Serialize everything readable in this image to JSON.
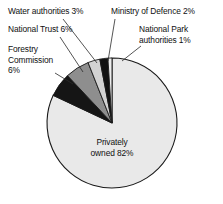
{
  "chart_data": {
    "type": "pie",
    "title": "",
    "subtitle": "",
    "xlabel": "",
    "ylabel": "",
    "legend_position": "none",
    "grid": false,
    "unit": "%",
    "total": 100,
    "start_angle_deg": 0,
    "direction": "counterclockwise",
    "categories": [
      "National Park authorities",
      "Ministry of Defence",
      "Water authorities",
      "National Trust",
      "Forestry Commission",
      "Privately owned"
    ],
    "values": [
      1,
      2,
      3,
      6,
      6,
      82
    ],
    "slices": [
      {
        "name": "National Park authorities",
        "value": 1,
        "label": "National Park\nauthorities 1%",
        "color": "#ececec",
        "start_pct": 0,
        "end_pct": 1
      },
      {
        "name": "Ministry of Defence",
        "value": 2,
        "label": "Ministry of Defence 2%",
        "color": "#121212",
        "start_pct": 1,
        "end_pct": 3
      },
      {
        "name": "Water authorities",
        "value": 3,
        "label": "Water authorities 3%",
        "color": "#d2d2d2",
        "start_pct": 3,
        "end_pct": 6
      },
      {
        "name": "National Trust",
        "value": 6,
        "label": "National Trust 6%",
        "color": "#8e8e8e",
        "start_pct": 6,
        "end_pct": 12
      },
      {
        "name": "Forestry Commission",
        "value": 6,
        "label": "Forestry\nCommission\n6%",
        "color": "#151515",
        "start_pct": 12,
        "end_pct": 18
      },
      {
        "name": "Privately owned",
        "value": 82,
        "label": "Privately\nowned 82%",
        "color": "#e9e9e9",
        "start_pct": 18,
        "end_pct": 100
      }
    ],
    "geometry": {
      "center_x": 112,
      "center_y": 123,
      "radius": 65
    },
    "colors": {
      "outline": "#1a1a1a",
      "text": "#101010",
      "background": "#ffffff",
      "leader_line": "#2a2a2a"
    }
  }
}
